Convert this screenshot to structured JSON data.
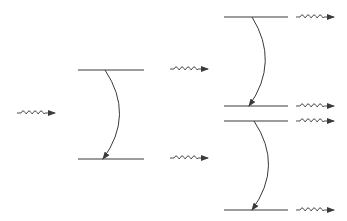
{
  "diagram": {
    "stroke_color": "#3a3a3a",
    "background": "#ffffff",
    "levels": [
      {
        "id": "stage1-upper",
        "x1": 78,
        "x2": 144,
        "y": 70
      },
      {
        "id": "stage1-lower",
        "x1": 78,
        "x2": 144,
        "y": 159
      },
      {
        "id": "stage2a-upper",
        "x1": 224,
        "x2": 288,
        "y": 17
      },
      {
        "id": "stage2a-lower",
        "x1": 224,
        "x2": 288,
        "y": 106
      },
      {
        "id": "stage2b-upper",
        "x1": 224,
        "x2": 288,
        "y": 121
      },
      {
        "id": "stage2b-lower",
        "x1": 224,
        "x2": 288,
        "y": 210
      }
    ],
    "transitions": [
      {
        "id": "stage1-decay",
        "from": [
          105,
          70
        ],
        "ctrl": [
          135,
          115
        ],
        "to": [
          103,
          159
        ]
      },
      {
        "id": "stage2a-decay",
        "from": [
          252,
          17
        ],
        "ctrl": [
          280,
          62
        ],
        "to": [
          249,
          106
        ]
      },
      {
        "id": "stage2b-decay",
        "from": [
          254,
          121
        ],
        "ctrl": [
          284,
          166
        ],
        "to": [
          252,
          210
        ]
      }
    ],
    "photons": [
      {
        "id": "incident-photon",
        "x": 17,
        "y": 113
      },
      {
        "id": "stage1-upper-photon",
        "x": 170,
        "y": 69
      },
      {
        "id": "stage1-lower-photon",
        "x": 170,
        "y": 158
      },
      {
        "id": "stage2a-upper-photon",
        "x": 296,
        "y": 17
      },
      {
        "id": "stage2a-lower-photon",
        "x": 296,
        "y": 106
      },
      {
        "id": "stage2b-upper-photon",
        "x": 296,
        "y": 121
      },
      {
        "id": "stage2b-lower-photon",
        "x": 296,
        "y": 210
      }
    ]
  }
}
